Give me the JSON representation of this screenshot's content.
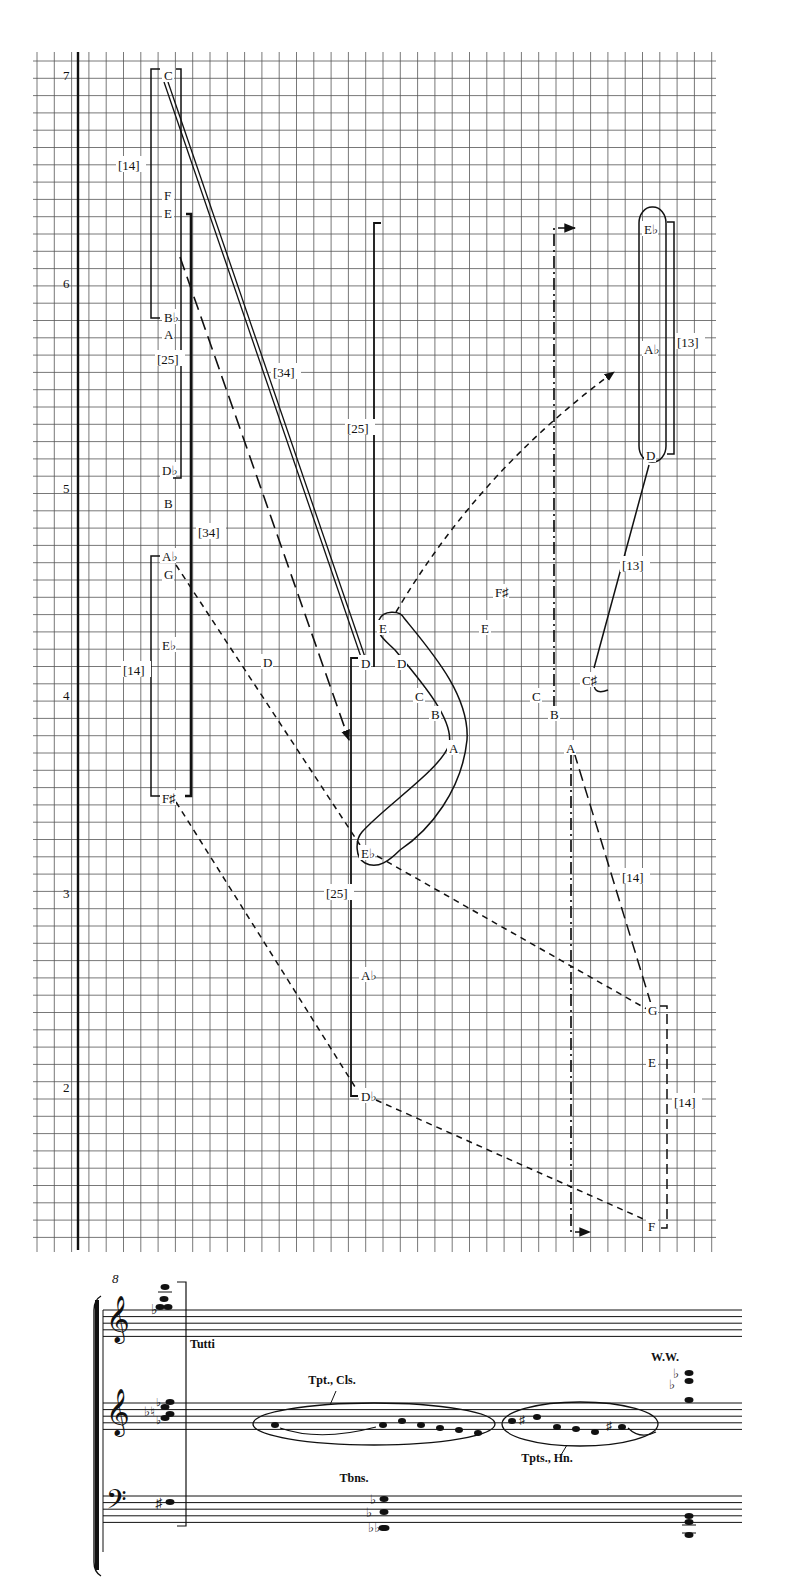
{
  "graph": {
    "grid": {
      "x0": 37,
      "x1": 712,
      "y0": 61,
      "y1": 1240,
      "step": 17.3,
      "color": "#555555"
    },
    "axis": {
      "x": 76,
      "ticks": [
        {
          "label": "7",
          "y": 75
        },
        {
          "label": "6",
          "y": 283
        },
        {
          "label": "5",
          "y": 488
        },
        {
          "label": "4",
          "y": 695
        },
        {
          "label": "3",
          "y": 893
        },
        {
          "label": "2",
          "y": 1087
        }
      ]
    },
    "notes": [
      {
        "id": "n-c-top",
        "label": "C",
        "x": 164,
        "y": 75
      },
      {
        "id": "n-f",
        "label": "F",
        "x": 164,
        "y": 195
      },
      {
        "id": "n-e",
        "label": "E",
        "x": 164,
        "y": 213
      },
      {
        "id": "n-bb",
        "label": "B♭",
        "x": 164,
        "y": 317
      },
      {
        "id": "n-a",
        "label": "A",
        "x": 164,
        "y": 334
      },
      {
        "id": "n-db",
        "label": "D♭",
        "x": 162,
        "y": 470
      },
      {
        "id": "n-b",
        "label": "B",
        "x": 164,
        "y": 503
      },
      {
        "id": "n-ab",
        "label": "A♭",
        "x": 162,
        "y": 556
      },
      {
        "id": "n-g",
        "label": "G",
        "x": 164,
        "y": 574
      },
      {
        "id": "n-eb",
        "label": "E♭",
        "x": 162,
        "y": 645
      },
      {
        "id": "n-fs",
        "label": "F♯",
        "x": 162,
        "y": 798
      },
      {
        "id": "n-d-mid",
        "label": "D",
        "x": 263,
        "y": 662
      },
      {
        "id": "n-d-bar",
        "label": "D",
        "x": 361,
        "y": 663
      },
      {
        "id": "n-e-loop",
        "label": "E",
        "x": 379,
        "y": 628
      },
      {
        "id": "n-d-loop",
        "label": "D",
        "x": 397,
        "y": 663
      },
      {
        "id": "n-c-loop",
        "label": "C",
        "x": 415,
        "y": 696
      },
      {
        "id": "n-b-loop",
        "label": "B",
        "x": 431,
        "y": 714
      },
      {
        "id": "n-a-loop",
        "label": "A",
        "x": 449,
        "y": 748
      },
      {
        "id": "n-eb-low",
        "label": "E♭",
        "x": 361,
        "y": 853
      },
      {
        "id": "n-ab-low",
        "label": "A♭",
        "x": 361,
        "y": 975
      },
      {
        "id": "n-db-low",
        "label": "D♭",
        "x": 361,
        "y": 1096
      },
      {
        "id": "n-fs-right",
        "label": "F♯",
        "x": 495,
        "y": 592
      },
      {
        "id": "n-e-right",
        "label": "E",
        "x": 481,
        "y": 628
      },
      {
        "id": "n-c-right",
        "label": "C",
        "x": 532,
        "y": 696
      },
      {
        "id": "n-b-right",
        "label": "B",
        "x": 550,
        "y": 714
      },
      {
        "id": "n-a-right",
        "label": "A",
        "x": 566,
        "y": 748
      },
      {
        "id": "n-cs",
        "label": "C♯",
        "x": 582,
        "y": 680
      },
      {
        "id": "n-eb-top",
        "label": "E♭",
        "x": 644,
        "y": 229
      },
      {
        "id": "n-ab-top",
        "label": "A♭",
        "x": 644,
        "y": 349
      },
      {
        "id": "n-d-top",
        "label": "D",
        "x": 646,
        "y": 455
      },
      {
        "id": "n-g-right",
        "label": "G",
        "x": 648,
        "y": 1010
      },
      {
        "id": "n-e-low-right",
        "label": "E",
        "x": 648,
        "y": 1062
      },
      {
        "id": "n-f-bottom",
        "label": "F",
        "x": 648,
        "y": 1226
      }
    ],
    "intervals": [
      {
        "label": "[14]",
        "x": 118,
        "y": 165
      },
      {
        "label": "[25]",
        "x": 157,
        "y": 359
      },
      {
        "label": "[34]",
        "x": 273,
        "y": 372
      },
      {
        "label": "[25]",
        "x": 347,
        "y": 428
      },
      {
        "label": "[34]",
        "x": 198,
        "y": 532
      },
      {
        "label": "[14]",
        "x": 123,
        "y": 670
      },
      {
        "label": "[25]",
        "x": 326,
        "y": 893
      },
      {
        "label": "[13]",
        "x": 677,
        "y": 342
      },
      {
        "label": "[13]",
        "x": 622,
        "y": 565
      },
      {
        "label": "[14]",
        "x": 622,
        "y": 877
      },
      {
        "label": "[14]",
        "x": 674,
        "y": 1102
      }
    ]
  },
  "score": {
    "measure_number": "8",
    "tutti_label": "Tutti",
    "instrument_labels": [
      {
        "label": "Tpt., Cls.",
        "x": 332,
        "y": 1384
      },
      {
        "label": "Tpts., Hn.",
        "x": 547,
        "y": 1462
      },
      {
        "label": "Tbns.",
        "x": 354,
        "y": 1482
      },
      {
        "label": "W.W.",
        "x": 665,
        "y": 1361
      }
    ],
    "staves": [
      {
        "name": "upper-treble",
        "clef": "treble",
        "top": 1310
      },
      {
        "name": "middle-treble",
        "clef": "treble",
        "top": 1403
      },
      {
        "name": "bass",
        "clef": "bass",
        "top": 1496
      }
    ]
  }
}
